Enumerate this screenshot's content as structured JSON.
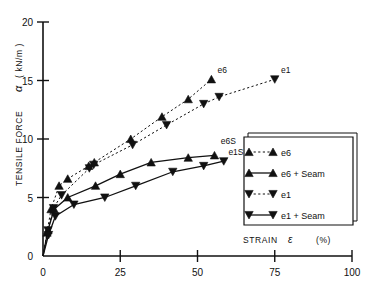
{
  "chart_data": {
    "type": "line",
    "title": "",
    "xlabel": "STRAIN",
    "xlabel_symbol": "ε",
    "xlabel_unit": "(%)",
    "ylabel": "TENSILE FORCE",
    "ylabel_symbol": "α",
    "ylabel_unit": "( kN/m )",
    "xlim": [
      0,
      100
    ],
    "ylim": [
      0,
      20
    ],
    "xticks": [
      0,
      25,
      50,
      75,
      100
    ],
    "yticks": [
      0,
      5,
      10,
      15,
      20
    ],
    "xtick_labels": [
      "0",
      "25",
      "50",
      "75",
      "100"
    ],
    "ytick_labels": [
      "0",
      "5",
      "10",
      "15",
      "20"
    ],
    "grid": false,
    "legend_position": "right-lower",
    "series": [
      {
        "name": "e6",
        "marker": "triangle-up",
        "line": "dashed",
        "end_label": "e6",
        "x": [
          0,
          1.3,
          2.6,
          5.2,
          8.0,
          14.8,
          16.6,
          28.4,
          38.5,
          47.0,
          54.5
        ],
        "y": [
          0,
          2.0,
          4.0,
          6.0,
          6.6,
          7.7,
          8.0,
          10.0,
          11.9,
          13.4,
          15.1
        ]
      },
      {
        "name": "e1",
        "marker": "triangle-down",
        "line": "dashed",
        "end_label": "e1",
        "x": [
          0,
          1.6,
          3.4,
          6.0,
          15.0,
          16.4,
          29.0,
          40.0,
          52.0,
          57.0,
          75.0
        ],
        "y": [
          0,
          2.2,
          4.1,
          5.2,
          7.5,
          7.8,
          9.5,
          11.2,
          13.0,
          13.6,
          15.1
        ]
      },
      {
        "name": "e6 + Seam",
        "marker": "triangle-up",
        "line": "solid",
        "end_label": "e6S",
        "x": [
          0,
          1.6,
          3.6,
          8.0,
          17.0,
          25.0,
          35.0,
          47.0,
          55.5
        ],
        "y": [
          0,
          2.2,
          4.0,
          5.0,
          6.0,
          7.0,
          8.0,
          8.4,
          8.6
        ]
      },
      {
        "name": "e1 + Seam",
        "marker": "triangle-down",
        "line": "solid",
        "end_label": "e1S",
        "x": [
          0,
          1.8,
          4.0,
          10.0,
          20.0,
          30.0,
          42.0,
          52.0,
          58.5
        ],
        "y": [
          0,
          1.8,
          3.4,
          4.4,
          5.0,
          6.0,
          7.2,
          7.7,
          8.1
        ]
      }
    ],
    "annotations": [
      {
        "text": "e6",
        "x": 56.5,
        "y": 15.6
      },
      {
        "text": "e1",
        "x": 77.0,
        "y": 15.6
      },
      {
        "text": "e6S",
        "x": 57.5,
        "y": 9.6
      },
      {
        "text": "e1S",
        "x": 60.0,
        "y": 8.6
      }
    ]
  },
  "legend": {
    "items": [
      {
        "label": "e6",
        "marker": "triangle-up",
        "line": "dashed"
      },
      {
        "label": "e6 + Seam",
        "marker": "triangle-up",
        "line": "solid"
      },
      {
        "label": "e1",
        "marker": "triangle-down",
        "line": "dashed"
      },
      {
        "label": "e1 + Seam",
        "marker": "triangle-down",
        "line": "solid"
      }
    ]
  },
  "colors": {
    "axis": "#111111",
    "line": "#111111",
    "marker": "#111111",
    "background": "#ffffff"
  }
}
